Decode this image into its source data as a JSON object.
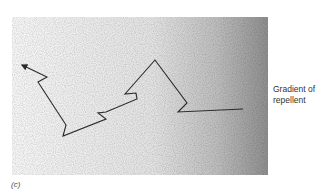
{
  "figure": {
    "panel_label": "(c)",
    "gradient_label_line1": "Gradient of",
    "gradient_label_line2": "repellent",
    "field": {
      "x": 12,
      "y": 17,
      "width": 256,
      "height": 158,
      "light_color": "#f4f4f4",
      "dark_color": "#8a8a8a",
      "gradient_direction": "left-to-right"
    },
    "path": {
      "description": "biased random walk (run-and-tumble) moving away from repellent",
      "stroke": "#2a2a2a",
      "points": [
        [
          243,
          109
        ],
        [
          178,
          112
        ],
        [
          187,
          103
        ],
        [
          155,
          60
        ],
        [
          125,
          94
        ],
        [
          136,
          93
        ],
        [
          137,
          99
        ],
        [
          106,
          112
        ],
        [
          98,
          113
        ],
        [
          106,
          119
        ],
        [
          63,
          136
        ],
        [
          66,
          125
        ],
        [
          38,
          82
        ],
        [
          47,
          77
        ],
        [
          22,
          65
        ]
      ],
      "arrow_end": [
        22,
        65
      ]
    }
  }
}
